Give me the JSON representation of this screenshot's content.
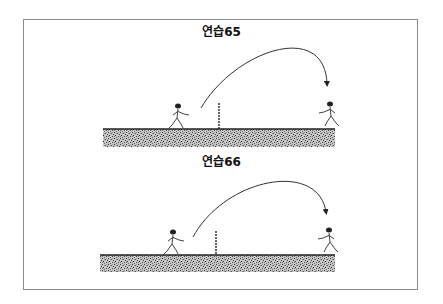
{
  "panels": [
    {
      "title": "연습65",
      "title_y": 22,
      "ground": {
        "x": 103,
        "y": 129,
        "w": 232,
        "h": 18
      },
      "net": {
        "x": 219,
        "top": 103,
        "bottom": 129
      },
      "left_player": {
        "x": 178,
        "y": 106
      },
      "right_player": {
        "x": 330,
        "y": 104
      },
      "arc": {
        "start": [
          201,
          108
        ],
        "ctrl1": [
          235,
          50
        ],
        "ctrl2": [
          325,
          20
        ],
        "end": [
          327,
          84
        ]
      }
    },
    {
      "title": "연습66",
      "title_y": 152,
      "ground": {
        "x": 100,
        "y": 255,
        "w": 235,
        "h": 17
      },
      "net": {
        "x": 216,
        "top": 231,
        "bottom": 255
      },
      "left_player": {
        "x": 173,
        "y": 232
      },
      "right_player": {
        "x": 329,
        "y": 230
      },
      "arc": {
        "start": [
          193,
          237
        ],
        "ctrl1": [
          225,
          178
        ],
        "ctrl2": [
          318,
          160
        ],
        "end": [
          326,
          212
        ]
      }
    }
  ],
  "colors": {
    "frame": "#8a8a8a",
    "ink": "#222222",
    "ground_dark": "#4a4a4a",
    "ground_light": "#bdbdbd"
  }
}
